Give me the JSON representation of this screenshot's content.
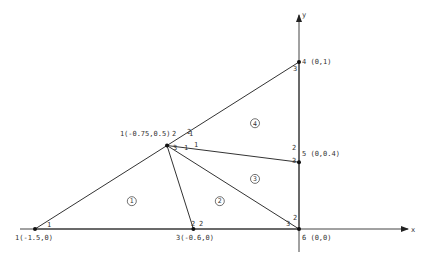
{
  "diagram": {
    "axes": {
      "x_label": "x",
      "y_label": "y"
    },
    "nodes": [
      {
        "id": 1,
        "x": -1.5,
        "y": 0,
        "label": "1(-1.5,0)"
      },
      {
        "id": 2,
        "x": -0.75,
        "y": 0.5,
        "label": "(-0.75,0.5)"
      },
      {
        "id": 3,
        "x": -0.6,
        "y": 0,
        "label": "3(-0.6,0)"
      },
      {
        "id": 4,
        "x": 0,
        "y": 1,
        "label": "4 (0,1)"
      },
      {
        "id": 5,
        "x": 0,
        "y": 0.4,
        "label": "5 (0,0.4)"
      },
      {
        "id": 6,
        "x": 0,
        "y": 0,
        "label": "6 (0,0)"
      }
    ],
    "elements": [
      {
        "id": 1,
        "label": "1",
        "nodes": [
          1,
          3,
          2
        ]
      },
      {
        "id": 2,
        "label": "2",
        "nodes": [
          3,
          6,
          2
        ]
      },
      {
        "id": 3,
        "label": "3",
        "nodes": [
          2,
          6,
          5
        ]
      },
      {
        "id": 4,
        "label": "4",
        "nodes": [
          2,
          5,
          4
        ]
      }
    ],
    "local_numbers": [
      {
        "text": "1",
        "at": "node1-elem1"
      },
      {
        "text": "2",
        "at": "node2-top"
      },
      {
        "text": "3",
        "at": "node2-elem1"
      },
      {
        "text": "1",
        "at": "node2-elem2"
      },
      {
        "text": "1",
        "at": "node2-elem3"
      },
      {
        "text": "1",
        "at": "node2-elem4"
      },
      {
        "text": "2",
        "at": "node3-elem1"
      },
      {
        "text": "2",
        "at": "node3-elem2"
      },
      {
        "text": "3",
        "at": "node4-elem4"
      },
      {
        "text": "2",
        "at": "node5-elem4"
      },
      {
        "text": "3",
        "at": "node5-elem3"
      },
      {
        "text": "2",
        "at": "node6-elem3"
      },
      {
        "text": "3",
        "at": "node6-elem2"
      }
    ],
    "node2_prefix": "1",
    "node2_suffix": "2"
  }
}
